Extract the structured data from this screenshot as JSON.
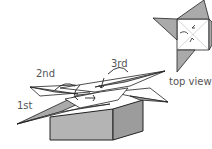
{
  "labels": {
    "first": "1st",
    "second": "2nd",
    "third": "3rd",
    "top_view": "top view"
  },
  "colors": {
    "line": "#222222",
    "fill_gray": "#aaaaaa",
    "fill_light": "#ffffff",
    "box_front": "#b4b4b4",
    "box_side": "#9c9c9c",
    "label": "#555555"
  }
}
